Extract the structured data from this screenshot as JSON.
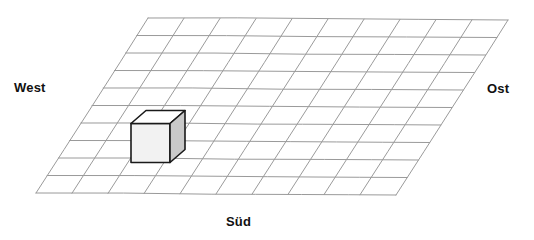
{
  "figure": {
    "type": "perspective-grid-diagram",
    "background_color": "#ffffff"
  },
  "labels": {
    "west": "West",
    "ost": "Ost",
    "sued": "Süd"
  },
  "grid": {
    "columns": 10,
    "rows": 10,
    "line_color": "#9a9a9a",
    "line_width": 1,
    "corners": {
      "top_left": {
        "x": 148,
        "y": 18
      },
      "top_right": {
        "x": 508,
        "y": 20
      },
      "bottom_right": {
        "x": 396,
        "y": 195
      },
      "bottom_left": {
        "x": 36,
        "y": 194
      }
    }
  },
  "cube": {
    "name": "white-cube",
    "grid_cell": {
      "column": 3,
      "row": 6
    },
    "outline_color": "#1a1a1a",
    "top_face_color": "#ffffff",
    "front_face_color": "#f2f2f2",
    "side_face_color": "#c9c9c9",
    "bounds": {
      "x": 130,
      "y": 110,
      "width": 55,
      "height": 53
    }
  }
}
